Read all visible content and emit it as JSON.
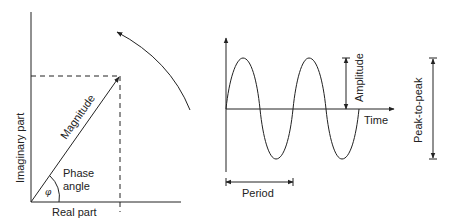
{
  "phasor": {
    "y_axis_label": "Imaginary part",
    "x_axis_label": "Real part",
    "vector_label": "Magnitude",
    "angle_label_line1": "Phase",
    "angle_label_line2": "angle",
    "angle_symbol": "φ",
    "rotation_arrow": "counterclockwise-rotation"
  },
  "waveform": {
    "time_label": "Time",
    "amplitude_label": "Amplitude",
    "period_label": "Period",
    "peak_to_peak_label": "Peak-to-peak",
    "wave_type": "sine",
    "cycles": 2
  },
  "colors": {
    "line": "#222222",
    "background": "#ffffff"
  }
}
